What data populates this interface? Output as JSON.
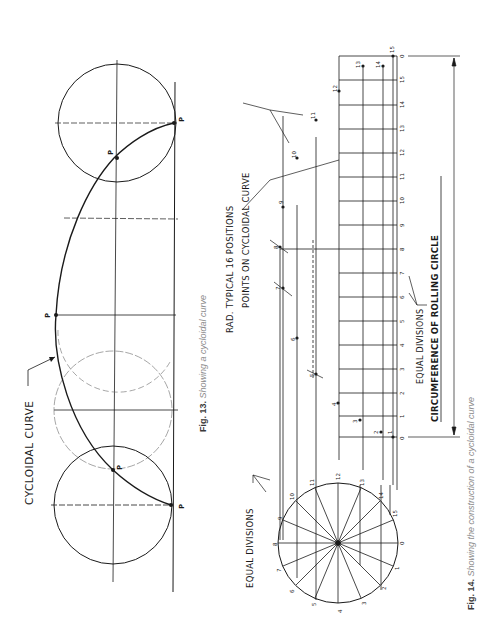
{
  "fig13": {
    "caption_num": "Fig. 13.",
    "caption_text": " Showing a cycloidal curve",
    "label_curve": "CYCLOIDAL  CURVE",
    "point_label": "P"
  },
  "fig14": {
    "caption_num": "Fig. 14.",
    "caption_text": " Showing the construction of a cycloidal curve",
    "label_points": "POINTS ON CYCLOIDAL CURVE",
    "label_rad": "RAD. TYPICAL  16 POSITIONS",
    "label_equal_div_circle": "EQUAL  DIVISIONS",
    "label_equal_div_line": "EQUAL  DIVISIONS",
    "label_circumference": "CIRCUMFERENCE  OF  ROLLING  CIRCLE",
    "baseline_ticks": [
      "0",
      "15",
      "14",
      "13",
      "12",
      "11",
      "10",
      "9",
      "8",
      "7",
      "6",
      "5",
      "4",
      "3",
      "2",
      "1",
      "0"
    ],
    "circle_numbers": [
      "0",
      "1",
      "2",
      "3",
      "4",
      "5",
      "6",
      "7",
      "8",
      "9",
      "10",
      "11",
      "12",
      "13",
      "14",
      "15"
    ],
    "curve_point_numbers": [
      "1",
      "2",
      "3",
      "4",
      "5",
      "6",
      "7",
      "8",
      "9",
      "10",
      "11",
      "12",
      "13",
      "14",
      "15"
    ]
  },
  "colors": {
    "ink": "#1a1a1a",
    "caption": "#8a8a8a"
  }
}
